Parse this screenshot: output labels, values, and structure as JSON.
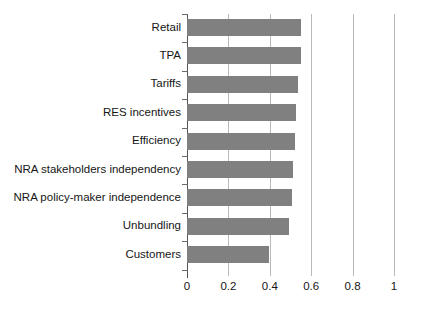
{
  "chart_data": {
    "type": "bar",
    "orientation": "horizontal",
    "title": "",
    "subtitle": "",
    "xlabel": "",
    "ylabel": "",
    "xlim": [
      0,
      1
    ],
    "grid": true,
    "legend": null,
    "categories": [
      "Retail",
      "TPA",
      "Tariffs",
      "RES incentives",
      "Efficiency",
      "NRA stakeholders independency",
      "NRA policy-maker independence",
      "Unbundling",
      "Customers"
    ],
    "values": [
      0.55,
      0.55,
      0.535,
      0.525,
      0.52,
      0.51,
      0.505,
      0.495,
      0.395
    ],
    "xticks": [
      0,
      0.2,
      0.4,
      0.6,
      0.8,
      1
    ],
    "xtick_labels": [
      "0",
      "0.2",
      "0.4",
      "0.6",
      "0.8",
      "1"
    ],
    "bar_color": "#808080",
    "gridline_color": "#b9b9b9",
    "axis_color": "#555555",
    "background_color": "#ffffff"
  }
}
